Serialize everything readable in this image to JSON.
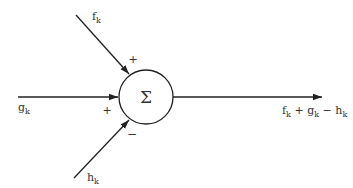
{
  "diagram": {
    "node": {
      "symbol": "Σ",
      "label": "summing junction"
    },
    "inputs": [
      {
        "name": "f",
        "subscript": "k",
        "sign": "+"
      },
      {
        "name": "g",
        "subscript": "k",
        "sign": "+"
      },
      {
        "name": "h",
        "subscript": "k",
        "sign": "−"
      }
    ],
    "output": {
      "expr": [
        {
          "t": "f",
          "s": "k"
        },
        {
          "t": " + "
        },
        {
          "t": "g",
          "s": "k"
        },
        {
          "t": " − "
        },
        {
          "t": "h",
          "s": "k"
        }
      ]
    }
  }
}
